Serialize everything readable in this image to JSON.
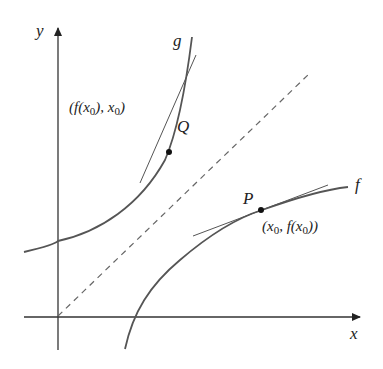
{
  "diagram": {
    "type": "inverse-function-tangent-lines",
    "axes": {
      "x_label": "x",
      "y_label": "y"
    },
    "curves": [
      {
        "name": "f",
        "label": "f"
      },
      {
        "name": "g",
        "label": "g"
      }
    ],
    "reference_line": {
      "equation": "y = x",
      "style": "dashed"
    },
    "points": [
      {
        "name": "P",
        "label": "P",
        "coordinate_label": "(x0, f(x0))",
        "on_curve": "f"
      },
      {
        "name": "Q",
        "label": "Q",
        "coordinate_label": "(f(x0), x0)",
        "on_curve": "g"
      }
    ],
    "colors": {
      "axis": "#333333",
      "curve": "#555555",
      "tangent": "#555555",
      "dashed": "#666666",
      "text": "#222222"
    }
  }
}
